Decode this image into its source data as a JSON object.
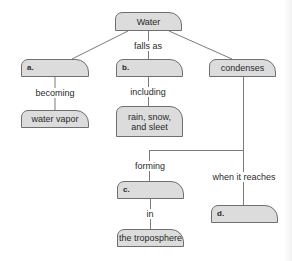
{
  "diagram": {
    "type": "concept-map",
    "colors": {
      "node_fill": "#dcdcdc",
      "node_border": "#6f6f6f",
      "line": "#7a7a7a",
      "background": "#ffffff"
    },
    "nodes": {
      "water": {
        "label": "Water"
      },
      "a": {
        "label": "a."
      },
      "b": {
        "label": "b."
      },
      "condenses": {
        "label": "condenses"
      },
      "water_vapor": {
        "label": "water vapor"
      },
      "rain_snow_sleet": {
        "label": "rain, snow, and sleet",
        "line1": "rain, snow,",
        "line2": "and sleet"
      },
      "c": {
        "label": "c."
      },
      "troposphere": {
        "label": "the troposphere"
      },
      "d": {
        "label": "d."
      }
    },
    "links": {
      "falls_as": {
        "from": "water",
        "to": "b",
        "label": "falls as"
      },
      "becoming": {
        "from": "a",
        "to": "water_vapor",
        "label": "becoming"
      },
      "including": {
        "from": "b",
        "to": "rain_snow_sleet",
        "label": "including"
      },
      "forming": {
        "from": "condenses",
        "to": "c",
        "label": "forming"
      },
      "when_it_reaches": {
        "from": "condenses",
        "to": "d",
        "label": "when it reaches"
      },
      "in": {
        "from": "c",
        "to": "troposphere",
        "label": "in"
      }
    }
  }
}
